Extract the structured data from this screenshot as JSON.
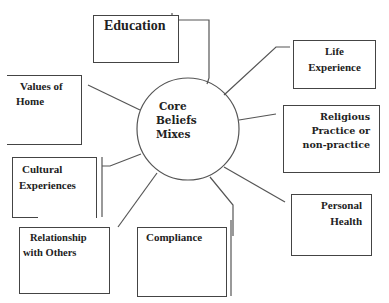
{
  "diagram": {
    "type": "hub-and-spoke concept map",
    "center": {
      "lines": [
        "Core",
        "Beliefs",
        "Mixes"
      ]
    },
    "nodes": [
      {
        "id": "education",
        "lines": [
          "Education"
        ]
      },
      {
        "id": "values-of-home",
        "lines": [
          "Values of",
          "Home"
        ]
      },
      {
        "id": "cultural-experiences",
        "lines": [
          "Cultural",
          "Experiences"
        ]
      },
      {
        "id": "relationship-with-others",
        "lines": [
          "Relationship",
          "with Others"
        ]
      },
      {
        "id": "compliance",
        "lines": [
          "Compliance"
        ]
      },
      {
        "id": "personal-health",
        "lines": [
          "Personal",
          "Health"
        ]
      },
      {
        "id": "religious-practice",
        "lines": [
          "Religious",
          "Practice or",
          "non-practice"
        ]
      },
      {
        "id": "life-experience",
        "lines": [
          "Life",
          "Experience"
        ]
      }
    ],
    "colors": {
      "stroke": "#444444",
      "text": "#222222",
      "background": "#ffffff"
    }
  }
}
